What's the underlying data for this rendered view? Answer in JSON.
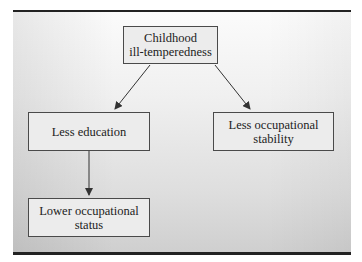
{
  "diagram": {
    "nodes": [
      {
        "id": "childhood",
        "label_line1": "Childhood",
        "label_line2": "ill-temperedness"
      },
      {
        "id": "education",
        "label_line1": "Less education",
        "label_line2": ""
      },
      {
        "id": "stability",
        "label_line1": "Less occupational",
        "label_line2": "stability"
      },
      {
        "id": "status",
        "label_line1": "Lower occupational",
        "label_line2": "status"
      }
    ],
    "edges": [
      {
        "from": "childhood",
        "to": "education"
      },
      {
        "from": "childhood",
        "to": "stability"
      },
      {
        "from": "education",
        "to": "status"
      }
    ],
    "colors": {
      "box_fill": "#ececec",
      "box_border": "#4a4a4a",
      "rule": "#222222",
      "arrow": "#333333"
    }
  }
}
